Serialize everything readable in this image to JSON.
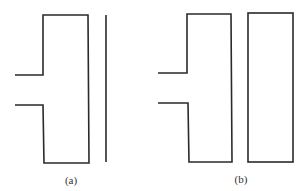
{
  "figure": {
    "stroke_color": "#2a2a2a",
    "panels": [
      {
        "id": "a",
        "label": "(a)",
        "description": "Waveguide-fed resonator with a thin metal strip (line) alongside",
        "main_shape": [
          [
            15,
            75
          ],
          [
            43,
            75
          ],
          [
            43,
            15
          ],
          [
            88,
            15
          ],
          [
            89,
            163
          ],
          [
            44,
            163
          ],
          [
            43,
            105
          ],
          [
            15,
            105
          ]
        ],
        "side_element": {
          "type": "line",
          "x1": 106,
          "y1": 15,
          "x2": 106,
          "y2": 162
        }
      },
      {
        "id": "b",
        "label": "(b)",
        "description": "Waveguide-fed resonator with a closed rectangular element alongside",
        "main_shape": [
          [
            158,
            73
          ],
          [
            187,
            73
          ],
          [
            187,
            14
          ],
          [
            231,
            14
          ],
          [
            232,
            162
          ],
          [
            189,
            162
          ],
          [
            188,
            103
          ],
          [
            158,
            103
          ]
        ],
        "side_element": {
          "type": "rect",
          "x": 248,
          "y": 13,
          "width": 45,
          "height": 149
        }
      }
    ]
  }
}
